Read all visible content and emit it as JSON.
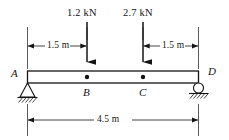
{
  "figure": {
    "type": "simply-supported-beam-free-body-diagram",
    "loads": [
      {
        "id": "load-at-B",
        "label": "1.2 kN",
        "magnitude": 1.2,
        "unit": "kN",
        "direction": "down",
        "at_point": "B",
        "x_px": 87
      },
      {
        "id": "load-at-C",
        "label": "2.7 kN",
        "magnitude": 2.7,
        "unit": "kN",
        "direction": "down",
        "at_point": "C",
        "x_px": 143
      }
    ],
    "dimensions": [
      {
        "id": "dim-A-to-B",
        "label": "1.5 m",
        "value": 1.5,
        "unit": "m",
        "from": "A",
        "to": "B"
      },
      {
        "id": "dim-C-to-D",
        "label": "1.5 m",
        "value": 1.5,
        "unit": "m",
        "from": "C",
        "to": "D"
      },
      {
        "id": "dim-A-to-D",
        "label": "4.5 m",
        "value": 4.5,
        "unit": "m",
        "from": "A",
        "to": "D"
      }
    ],
    "points": [
      {
        "id": "point-A",
        "label": "A",
        "support": "pin"
      },
      {
        "id": "point-B",
        "label": "B",
        "support": "none"
      },
      {
        "id": "point-C",
        "label": "C",
        "support": "none"
      },
      {
        "id": "point-D",
        "label": "D",
        "support": "roller"
      }
    ],
    "colors": {
      "line": "#141414",
      "beam_fill": "#ffffff",
      "background": "#ffffff",
      "hatch": "#141414"
    }
  }
}
